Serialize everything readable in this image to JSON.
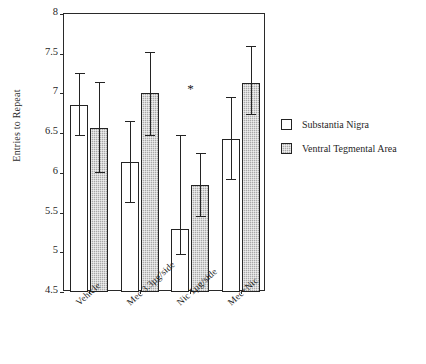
{
  "chart_data": {
    "type": "bar",
    "title": "",
    "xlabel": "",
    "ylabel": "Entries to Repeat",
    "ylim": [
      4.5,
      8
    ],
    "yticks": [
      "4.5",
      "5",
      "5.5",
      "6",
      "6.5",
      "7",
      "7.5",
      "8"
    ],
    "grid": false,
    "legend_position": "right",
    "categories": [
      "Vehicle",
      "Mec 3.3µg/side",
      "Nic 1µg/side",
      "Mec+Nic"
    ],
    "series": [
      {
        "name": "Substantia Nigra",
        "fill": "white",
        "values": [
          6.86,
          6.14,
          5.29,
          6.42
        ],
        "err_upper": [
          7.26,
          6.65,
          6.48,
          6.95
        ],
        "err_lower": [
          6.46,
          5.62,
          4.97,
          5.91
        ]
      },
      {
        "name": "Ventral Tegmental Area",
        "fill": "gray-stipple",
        "values": [
          6.57,
          7.0,
          5.85,
          7.13
        ],
        "err_upper": [
          7.15,
          7.52,
          6.25,
          7.6
        ],
        "err_lower": [
          6.0,
          6.46,
          5.44,
          6.73
        ]
      }
    ],
    "annotations": [
      {
        "label": "*",
        "category": "Nic 1µg/side",
        "y": 7.14
      }
    ]
  },
  "legend": {
    "items": [
      {
        "label": "Substantia Nigra",
        "swatch": "white-square"
      },
      {
        "label": "Ventral Tegmental Area",
        "swatch": "gray-stipple-square"
      }
    ]
  },
  "colors": {
    "axis": "#2a2a2a",
    "bar_white": "#ffffff",
    "bar_gray": "#a8a8a8",
    "text": "#1f1f1f"
  }
}
